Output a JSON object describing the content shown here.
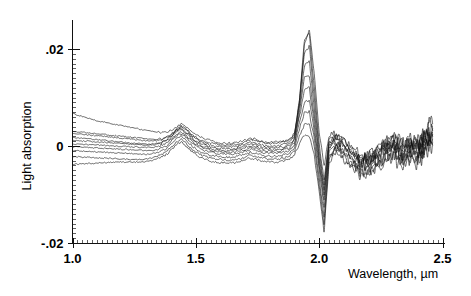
{
  "chart_data": {
    "type": "line",
    "title": "",
    "xlabel": "Wavelength, µm",
    "ylabel": "Light absorption",
    "xlim": [
      1.0,
      2.5
    ],
    "ylim": [
      -0.02,
      0.026
    ],
    "grid": false,
    "legend": "none",
    "x_tick_labels": [
      "1.0",
      "1.5",
      "2.0",
      "2.5"
    ],
    "x_tick_values": [
      1.0,
      1.5,
      2.0,
      2.5
    ],
    "x_minor_tick_step": 0.02,
    "y_tick_labels": [
      ".02",
      "0",
      "-.02"
    ],
    "y_tick_values": [
      0.02,
      0.0,
      -0.02
    ],
    "y_minor_tick_step": 0.001,
    "series_count": 10,
    "x": [
      1.0,
      1.02,
      1.04,
      1.06,
      1.08,
      1.1,
      1.12,
      1.14,
      1.16,
      1.18,
      1.2,
      1.22,
      1.24,
      1.26,
      1.28,
      1.3,
      1.32,
      1.34,
      1.36,
      1.38,
      1.4,
      1.42,
      1.44,
      1.46,
      1.48,
      1.5,
      1.52,
      1.54,
      1.56,
      1.58,
      1.6,
      1.62,
      1.64,
      1.66,
      1.68,
      1.7,
      1.72,
      1.74,
      1.76,
      1.78,
      1.8,
      1.82,
      1.84,
      1.86,
      1.88,
      1.9,
      1.92,
      1.94,
      1.96,
      1.98,
      2.0,
      2.02,
      2.04,
      2.06,
      2.08,
      2.1,
      2.12,
      2.14,
      2.16,
      2.18,
      2.2,
      2.22,
      2.24,
      2.26,
      2.28,
      2.3,
      2.32,
      2.34,
      2.36,
      2.38,
      2.4,
      2.42,
      2.44,
      2.46
    ],
    "series": [
      {
        "name": "sample-1",
        "values": [
          0.0068,
          0.0064,
          0.0061,
          0.0058,
          0.0055,
          0.0052,
          0.005,
          0.0048,
          0.0046,
          0.0044,
          0.0042,
          0.004,
          0.0038,
          0.0036,
          0.0034,
          0.0032,
          0.003,
          0.0029,
          0.0028,
          0.0029,
          0.0032,
          0.0038,
          0.0045,
          0.004,
          0.0031,
          0.0024,
          0.0018,
          0.0014,
          0.0011,
          0.0009,
          0.0007,
          0.0006,
          0.0006,
          0.0007,
          0.0009,
          0.0012,
          0.0016,
          0.0014,
          0.001,
          0.0008,
          0.0007,
          0.0008,
          0.0009,
          0.0011,
          0.0014,
          0.0026,
          0.0092,
          0.0205,
          0.0238,
          0.015,
          0.003,
          -0.004,
          0.002,
          0.0026,
          0.0022,
          0.0014,
          0.0004,
          -0.0006,
          -0.0014,
          -0.0018,
          -0.0016,
          -0.001,
          -0.0002,
          0.0006,
          0.0014,
          0.002,
          0.0012,
          0.0004,
          0.001,
          0.0018,
          0.0008,
          0.0022,
          0.0034,
          0.0046
        ]
      },
      {
        "name": "sample-2",
        "values": [
          0.003,
          0.0029,
          0.0028,
          0.0027,
          0.0026,
          0.0025,
          0.0024,
          0.0023,
          0.0022,
          0.0021,
          0.002,
          0.0019,
          0.0018,
          0.0017,
          0.0016,
          0.0015,
          0.0014,
          0.0014,
          0.0015,
          0.0018,
          0.0024,
          0.0034,
          0.0042,
          0.0036,
          0.0026,
          0.0018,
          0.0012,
          0.0008,
          0.0006,
          0.0004,
          0.0003,
          0.0003,
          0.0003,
          0.0004,
          0.0006,
          0.0009,
          0.0013,
          0.0011,
          0.0008,
          0.0006,
          0.0005,
          0.0005,
          0.0006,
          0.0008,
          0.0012,
          0.0024,
          0.0095,
          0.0215,
          0.0232,
          0.012,
          0.0005,
          -0.007,
          0.0014,
          0.0022,
          0.0018,
          0.001,
          0.0,
          -0.001,
          -0.0018,
          -0.0022,
          -0.002,
          -0.0014,
          -0.0006,
          0.0002,
          0.001,
          0.0016,
          0.0008,
          0.0,
          0.0006,
          0.0014,
          0.0004,
          0.0018,
          0.003,
          0.004
        ]
      },
      {
        "name": "sample-3",
        "values": [
          0.0026,
          0.0025,
          0.0024,
          0.0023,
          0.0022,
          0.0021,
          0.002,
          0.0019,
          0.0018,
          0.0017,
          0.0016,
          0.0015,
          0.0014,
          0.0013,
          0.0012,
          0.0011,
          0.0011,
          0.0011,
          0.0013,
          0.0017,
          0.0023,
          0.0033,
          0.004,
          0.0033,
          0.0023,
          0.0015,
          0.0009,
          0.0005,
          0.0002,
          0.0,
          -0.0001,
          -0.0002,
          -0.0002,
          -0.0001,
          0.0001,
          0.0004,
          0.0008,
          0.0006,
          0.0003,
          0.0001,
          0.0,
          0.0,
          0.0001,
          0.0003,
          0.0008,
          0.002,
          0.009,
          0.019,
          0.0205,
          0.01,
          -0.001,
          -0.008,
          0.0008,
          0.0018,
          0.0014,
          0.0006,
          -0.0004,
          -0.0014,
          -0.0022,
          -0.0026,
          -0.0024,
          -0.0018,
          -0.001,
          -0.0002,
          0.0006,
          0.0012,
          0.0004,
          -0.0004,
          0.0002,
          0.001,
          0.0,
          0.0014,
          0.0026,
          0.0036
        ]
      },
      {
        "name": "sample-4",
        "values": [
          0.0018,
          0.0017,
          0.0016,
          0.0015,
          0.0014,
          0.0013,
          0.0012,
          0.0011,
          0.001,
          0.0009,
          0.0008,
          0.0007,
          0.0006,
          0.0005,
          0.0005,
          0.0004,
          0.0004,
          0.0005,
          0.0008,
          0.0013,
          0.002,
          0.003,
          0.0036,
          0.0029,
          0.0019,
          0.0011,
          0.0005,
          0.0001,
          -0.0002,
          -0.0004,
          -0.0005,
          -0.0006,
          -0.0006,
          -0.0005,
          -0.0003,
          0.0,
          0.0004,
          0.0002,
          -0.0001,
          -0.0003,
          -0.0004,
          -0.0004,
          -0.0003,
          -0.0001,
          0.0004,
          0.0016,
          0.008,
          0.0165,
          0.0175,
          0.008,
          -0.002,
          -0.009,
          0.0004,
          0.0014,
          0.001,
          0.0002,
          -0.0008,
          -0.0018,
          -0.0026,
          -0.003,
          -0.0028,
          -0.0022,
          -0.0014,
          -0.0006,
          0.0002,
          0.0008,
          0.0,
          -0.0008,
          -0.0002,
          0.0006,
          -0.0004,
          0.001,
          0.0022,
          0.0032
        ]
      },
      {
        "name": "sample-5",
        "values": [
          0.0012,
          0.0011,
          0.001,
          0.001,
          0.0009,
          0.0008,
          0.0008,
          0.0007,
          0.0006,
          0.0006,
          0.0005,
          0.0004,
          0.0004,
          0.0003,
          0.0003,
          0.0002,
          0.0002,
          0.0003,
          0.0006,
          0.0011,
          0.0018,
          0.0028,
          0.0034,
          0.0026,
          0.0016,
          0.0008,
          0.0002,
          -0.0002,
          -0.0005,
          -0.0007,
          -0.0008,
          -0.0009,
          -0.0009,
          -0.0008,
          -0.0006,
          -0.0003,
          0.0001,
          -0.0001,
          -0.0004,
          -0.0006,
          -0.0007,
          -0.0007,
          -0.0006,
          -0.0004,
          0.0,
          0.0012,
          0.007,
          0.014,
          0.0145,
          0.006,
          -0.003,
          -0.01,
          -0.0002,
          0.001,
          0.0006,
          -0.0002,
          -0.0012,
          -0.0022,
          -0.003,
          -0.0034,
          -0.0032,
          -0.0026,
          -0.0018,
          -0.001,
          -0.0002,
          0.0004,
          -0.0004,
          -0.0012,
          -0.0006,
          0.0002,
          -0.0008,
          0.0006,
          0.0018,
          0.0028
        ]
      },
      {
        "name": "sample-6",
        "values": [
          0.0004,
          0.0004,
          0.0003,
          0.0003,
          0.0002,
          0.0002,
          0.0001,
          0.0001,
          0.0,
          0.0,
          -0.0001,
          -0.0001,
          -0.0002,
          -0.0002,
          -0.0003,
          -0.0003,
          -0.0003,
          -0.0002,
          0.0001,
          0.0006,
          0.0014,
          0.0024,
          0.003,
          0.0022,
          0.0012,
          0.0004,
          -0.0002,
          -0.0006,
          -0.0009,
          -0.0011,
          -0.0012,
          -0.0013,
          -0.0013,
          -0.0012,
          -0.001,
          -0.0007,
          -0.0003,
          -0.0005,
          -0.0008,
          -0.001,
          -0.0011,
          -0.0011,
          -0.001,
          -0.0008,
          -0.0004,
          0.0008,
          0.006,
          0.0115,
          0.012,
          0.0045,
          -0.004,
          -0.011,
          -0.0006,
          0.0006,
          0.0002,
          -0.0006,
          -0.0016,
          -0.0026,
          -0.0034,
          -0.0038,
          -0.0036,
          -0.003,
          -0.0022,
          -0.0014,
          -0.0006,
          0.0,
          -0.0008,
          -0.0016,
          -0.001,
          -0.0002,
          -0.0012,
          0.0002,
          0.0014,
          0.0024
        ]
      },
      {
        "name": "sample-7",
        "values": [
          -0.0002,
          -0.0002,
          -0.0003,
          -0.0003,
          -0.0004,
          -0.0004,
          -0.0005,
          -0.0005,
          -0.0006,
          -0.0006,
          -0.0007,
          -0.0007,
          -0.0008,
          -0.0008,
          -0.0009,
          -0.0009,
          -0.0009,
          -0.0008,
          -0.0005,
          0.0,
          0.001,
          0.002,
          0.0026,
          0.0018,
          0.0008,
          0.0,
          -0.0006,
          -0.001,
          -0.0013,
          -0.0015,
          -0.0016,
          -0.0017,
          -0.0017,
          -0.0016,
          -0.0014,
          -0.0011,
          -0.0007,
          -0.0009,
          -0.0012,
          -0.0014,
          -0.0015,
          -0.0015,
          -0.0014,
          -0.0012,
          -0.0008,
          0.0004,
          0.0048,
          0.009,
          0.0095,
          0.003,
          -0.005,
          -0.0125,
          -0.0012,
          0.0002,
          -0.0002,
          -0.001,
          -0.002,
          -0.003,
          -0.0038,
          -0.0042,
          -0.004,
          -0.0034,
          -0.0026,
          -0.0018,
          -0.001,
          -0.0004,
          -0.0012,
          -0.002,
          -0.0014,
          -0.0006,
          -0.0016,
          -0.0002,
          0.001,
          0.002
        ]
      },
      {
        "name": "sample-8",
        "values": [
          -0.001,
          -0.001,
          -0.0011,
          -0.0011,
          -0.0012,
          -0.0012,
          -0.0013,
          -0.0013,
          -0.0014,
          -0.0014,
          -0.0015,
          -0.0015,
          -0.0016,
          -0.0016,
          -0.0017,
          -0.0017,
          -0.0016,
          -0.0014,
          -0.0011,
          -0.0006,
          0.0004,
          0.0014,
          0.002,
          0.0012,
          0.0002,
          -0.0006,
          -0.0012,
          -0.0016,
          -0.0019,
          -0.0021,
          -0.0022,
          -0.0023,
          -0.0023,
          -0.0022,
          -0.002,
          -0.0017,
          -0.0013,
          -0.0015,
          -0.0018,
          -0.002,
          -0.0021,
          -0.0021,
          -0.002,
          -0.0018,
          -0.0014,
          -0.0002,
          0.0035,
          0.0068,
          0.007,
          0.0015,
          -0.0065,
          -0.0145,
          -0.002,
          -0.0004,
          -0.0008,
          -0.0016,
          -0.0026,
          -0.0036,
          -0.0044,
          -0.0048,
          -0.0046,
          -0.004,
          -0.0032,
          -0.0024,
          -0.0016,
          -0.001,
          -0.0018,
          -0.0026,
          -0.002,
          -0.0012,
          -0.0022,
          -0.0008,
          0.0004,
          0.0014
        ]
      },
      {
        "name": "sample-9",
        "values": [
          -0.0022,
          -0.0022,
          -0.0023,
          -0.0023,
          -0.0024,
          -0.0024,
          -0.0025,
          -0.0025,
          -0.0026,
          -0.0026,
          -0.0027,
          -0.0027,
          -0.0028,
          -0.0028,
          -0.0028,
          -0.0027,
          -0.0025,
          -0.0022,
          -0.0018,
          -0.0012,
          -0.0002,
          0.0008,
          0.0014,
          0.0006,
          -0.0004,
          -0.0012,
          -0.0018,
          -0.0022,
          -0.0025,
          -0.0027,
          -0.0028,
          -0.0029,
          -0.0029,
          -0.0028,
          -0.0026,
          -0.0023,
          -0.0019,
          -0.0021,
          -0.0024,
          -0.0026,
          -0.0027,
          -0.0027,
          -0.0026,
          -0.0024,
          -0.002,
          -0.001,
          0.002,
          0.0045,
          0.0045,
          0.0,
          -0.008,
          -0.016,
          -0.0028,
          -0.001,
          -0.0014,
          -0.0022,
          -0.0032,
          -0.0042,
          -0.005,
          -0.0054,
          -0.0052,
          -0.0046,
          -0.0038,
          -0.003,
          -0.0022,
          -0.0016,
          -0.0024,
          -0.0032,
          -0.0026,
          -0.0018,
          -0.0028,
          -0.0014,
          -0.0002,
          0.0008
        ]
      },
      {
        "name": "sample-10",
        "values": [
          -0.0038,
          -0.0037,
          -0.0037,
          -0.0036,
          -0.0036,
          -0.0035,
          -0.0035,
          -0.0034,
          -0.0034,
          -0.0033,
          -0.0033,
          -0.0033,
          -0.0033,
          -0.0033,
          -0.0033,
          -0.0032,
          -0.003,
          -0.0027,
          -0.0023,
          -0.0018,
          -0.0008,
          0.0002,
          0.0008,
          0.0,
          -0.001,
          -0.0018,
          -0.0024,
          -0.0028,
          -0.0031,
          -0.0033,
          -0.0034,
          -0.0035,
          -0.0035,
          -0.0034,
          -0.0032,
          -0.0029,
          -0.0025,
          -0.0027,
          -0.003,
          -0.0032,
          -0.0033,
          -0.0033,
          -0.0032,
          -0.003,
          -0.0026,
          -0.0018,
          0.0005,
          0.0022,
          0.002,
          -0.002,
          -0.0095,
          -0.0175,
          -0.0036,
          -0.0016,
          -0.002,
          -0.0028,
          -0.0038,
          -0.0048,
          -0.0056,
          -0.006,
          -0.0058,
          -0.0052,
          -0.0044,
          -0.0036,
          -0.0028,
          -0.0022,
          -0.003,
          -0.0038,
          -0.0032,
          -0.0024,
          -0.0034,
          -0.002,
          -0.0008,
          0.0002
        ]
      }
    ]
  }
}
